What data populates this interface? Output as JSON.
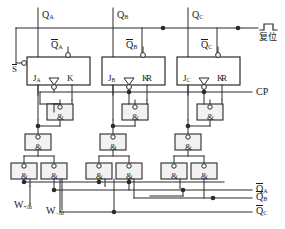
{
  "diagram": {
    "colors": {
      "wire": "#2b2b2b",
      "text": "#1a1a1a",
      "background": "#ffffff",
      "gate_fill": "#f2f2f2"
    }
  },
  "top_signals": [
    {
      "name": "q-a",
      "label": "Q",
      "sub": "A"
    },
    {
      "name": "q-b",
      "label": "Q",
      "sub": "B"
    },
    {
      "name": "q-c",
      "label": "Q",
      "sub": "C"
    }
  ],
  "reset": {
    "label": "复位",
    "waveform": "negative-pulse"
  },
  "clock": {
    "label": "CP"
  },
  "set_input": {
    "label": "S"
  },
  "flipflops": [
    {
      "name": "flipflop-a",
      "qbar_label": "Q",
      "qbar_sub": "A",
      "j_label": "J",
      "j_sub": "A",
      "k_label": "K",
      "r_label": ""
    },
    {
      "name": "flipflop-b",
      "qbar_label": "Q",
      "qbar_sub": "B",
      "j_label": "J",
      "j_sub": "B",
      "k_label": "K",
      "r_label": "R"
    },
    {
      "name": "flipflop-c",
      "qbar_label": "Q",
      "qbar_sub": "C",
      "j_label": "J",
      "j_sub": "C",
      "k_label": "K",
      "r_label": "R"
    }
  ],
  "gates": {
    "symbol": "&",
    "clock_gates": [
      {
        "name": "nand-clock-a"
      },
      {
        "name": "nand-clock-b"
      },
      {
        "name": "nand-clock-c"
      }
    ],
    "upper_gates": [
      {
        "name": "nand-upper-a"
      },
      {
        "name": "nand-upper-b"
      },
      {
        "name": "nand-upper-c"
      }
    ],
    "lower_gates": [
      {
        "name": "nand-lower-a1"
      },
      {
        "name": "nand-lower-a2"
      },
      {
        "name": "nand-lower-b1"
      },
      {
        "name": "nand-lower-b2"
      },
      {
        "name": "nand-lower-c1"
      },
      {
        "name": "nand-lower-c2"
      }
    ]
  },
  "bottom_inputs": [
    {
      "name": "w-plus",
      "label": "W",
      "sub": "+Δt"
    },
    {
      "name": "w-minus",
      "label": "W",
      "sub": "−Δt"
    }
  ],
  "right_outputs": [
    {
      "name": "qbar-a-out",
      "label": "Q",
      "sub": "A"
    },
    {
      "name": "qbar-b-out",
      "label": "Q",
      "sub": "B"
    },
    {
      "name": "qbar-c-out",
      "label": "Q",
      "sub": "C"
    }
  ]
}
